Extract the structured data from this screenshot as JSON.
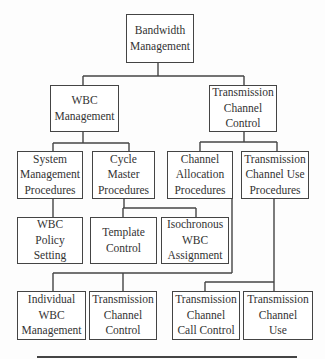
{
  "diagram": {
    "type": "hierarchy-tree",
    "nodes": [
      {
        "id": "root",
        "lines": [
          "Bandwidth",
          "Management"
        ],
        "parent": null
      },
      {
        "id": "wbc_mgmt",
        "lines": [
          "WBC",
          "Management"
        ],
        "parent": "root"
      },
      {
        "id": "tcc",
        "lines": [
          "Transmission",
          "Channel",
          "Control"
        ],
        "parent": "root"
      },
      {
        "id": "smp",
        "lines": [
          "System",
          "Management",
          "Procedures"
        ],
        "parent": "wbc_mgmt"
      },
      {
        "id": "cmp",
        "lines": [
          "Cycle",
          "Master",
          "Procedures"
        ],
        "parent": "wbc_mgmt"
      },
      {
        "id": "cap",
        "lines": [
          "Channel",
          "Allocation",
          "Procedures"
        ],
        "parent": "tcc"
      },
      {
        "id": "tcup",
        "lines": [
          "Transmission",
          "Channel Use",
          "Procedures"
        ],
        "parent": "tcc"
      },
      {
        "id": "wps",
        "lines": [
          "WBC",
          "Policy",
          "Setting"
        ],
        "parent": "smp"
      },
      {
        "id": "tpl",
        "lines": [
          "Template",
          "Control"
        ],
        "parent": "cmp"
      },
      {
        "id": "iso",
        "lines": [
          "Isochronous",
          "WBC",
          "Assignment"
        ],
        "parent": "cmp"
      },
      {
        "id": "iwm",
        "lines": [
          "Individual",
          "WBC",
          "Management"
        ],
        "parent": "cap"
      },
      {
        "id": "tcc2",
        "lines": [
          "Transmission",
          "Channel",
          "Control"
        ],
        "parent": "cap"
      },
      {
        "id": "tccc",
        "lines": [
          "Transmission",
          "Channel",
          "Call Control"
        ],
        "parent": "tcup"
      },
      {
        "id": "tcu",
        "lines": [
          "Transmission",
          "Channel",
          "Use"
        ],
        "parent": "tcup"
      }
    ]
  }
}
